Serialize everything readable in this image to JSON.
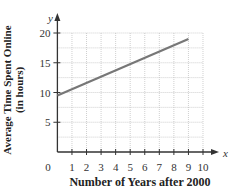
{
  "chart_data": {
    "type": "line",
    "title": "",
    "xlabel": "Number of Years after 2000",
    "ylabel": "Average Time Spent Online (in hours)",
    "ylabel_lines": [
      "Average Time Spent Online",
      "(in hours)"
    ],
    "x_axis_symbol": "x",
    "y_axis_symbol": "y",
    "xlim": [
      0,
      10
    ],
    "ylim": [
      0,
      20
    ],
    "x_ticks": [
      1,
      2,
      3,
      4,
      5,
      6,
      7,
      8,
      9,
      10
    ],
    "y_ticks": [
      5,
      10,
      15,
      20
    ],
    "origin_label": "0",
    "grid": true,
    "grid_minor_y": 2.5,
    "series": [
      {
        "name": "Average Time Spent Online",
        "x": [
          0,
          9
        ],
        "y": [
          9.5,
          19
        ],
        "color": "#777777"
      }
    ],
    "legend": null
  }
}
